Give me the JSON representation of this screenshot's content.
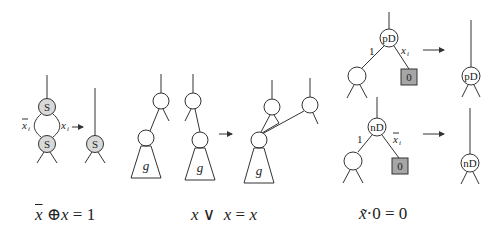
{
  "figure": {
    "panel_s": {
      "top_node_label": "S",
      "bottom_node_label": "S",
      "result_node_label": "S",
      "left_edge_var": "x",
      "left_edge_sub": "i",
      "left_edge_negated": true,
      "right_edge_var": "x",
      "right_edge_sub": "i",
      "formula": {
        "part1": "x",
        "op": "⊕",
        "part2": "x",
        "rhs": "= 1"
      }
    },
    "panel_merge": {
      "subgraph_label": "g",
      "formula": {
        "part1": "x",
        "op": "∨",
        "part2": "x",
        "eq": "=",
        "rhs": "x"
      }
    },
    "panel_pd": {
      "node_label": "pD",
      "edge_left_label": "1",
      "edge_right_var": "x",
      "edge_right_sub": "i",
      "terminal_label": "0",
      "result_node_label": "pD"
    },
    "panel_nd": {
      "node_label": "nD",
      "edge_left_label": "1",
      "edge_right_var": "x",
      "edge_right_sub": "i",
      "edge_right_negated": true,
      "terminal_label": "0",
      "result_node_label": "nD",
      "formula": {
        "part1": "x̃",
        "op": "·",
        "rhs": "0 = 0"
      }
    },
    "arrow_glyph": "→"
  }
}
